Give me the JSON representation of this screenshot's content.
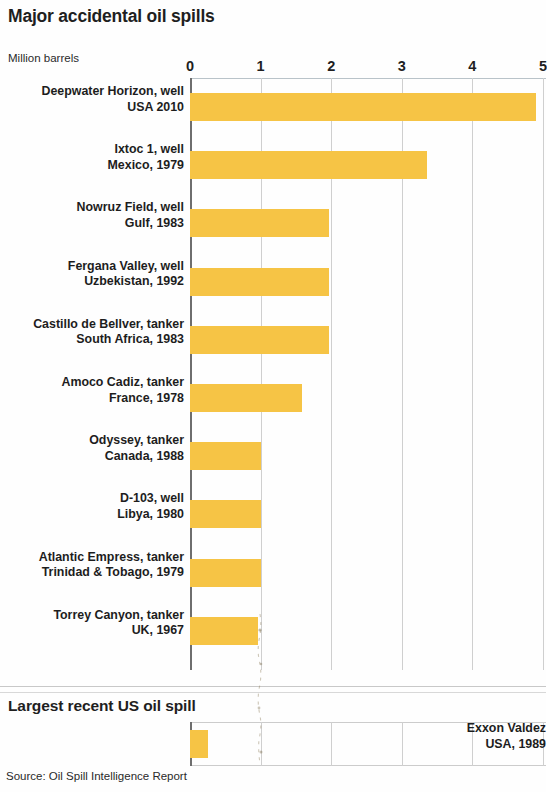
{
  "header": {
    "title": "Major accidental oil spills",
    "axis_unit": "Million barrels"
  },
  "section": {
    "title": "Largest recent US oil spill"
  },
  "source": {
    "text": "Source: Oil Spill Intelligence Report"
  },
  "colors": {
    "bar": "#f6c445",
    "axis": "#6e6e6e",
    "grid": "#cfcfcf",
    "text": "#1d1d1d"
  },
  "chart_data": {
    "type": "bar",
    "orientation": "horizontal",
    "title": "Major accidental oil spills",
    "xlabel": "Million barrels",
    "ylabel": "",
    "xlim": [
      0,
      5
    ],
    "ticks": [
      "0",
      "1",
      "2",
      "3",
      "4",
      "5"
    ],
    "grid": true,
    "legend": null,
    "unit": "Million barrels",
    "categories": [
      "Deepwater Horizon, well",
      "Ixtoc 1, well",
      "Nowruz Field, well",
      "Fergana Valley, well",
      "Castillo de Bellver, tanker",
      "Amoco Cadiz, tanker",
      "Odyssey, tanker",
      "D-103, well",
      "Atlantic Empress, tanker",
      "Torrey Canyon, tanker"
    ],
    "sublabels": [
      "USA 2010",
      "Mexico, 1979",
      "Gulf, 1983",
      "Uzbekistan, 1992",
      "South Africa, 1983",
      "France, 1978",
      "Canada, 1988",
      "Libya, 1980",
      "Trinidad & Tobago, 1979",
      "UK, 1967"
    ],
    "values": [
      4.9,
      3.35,
      1.97,
      1.97,
      1.97,
      1.59,
      1.0,
      1.0,
      1.0,
      0.96
    ],
    "secondary": {
      "title": "Largest recent US oil spill",
      "categories": [
        "Exxon Valdez"
      ],
      "sublabels": [
        "USA, 1989"
      ],
      "values": [
        0.26
      ]
    }
  }
}
